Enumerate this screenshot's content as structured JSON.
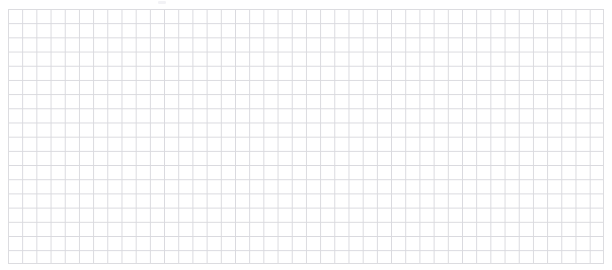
{
  "document": {
    "title": "Empty Grid Canvas",
    "width": 612,
    "height": 270,
    "background_color": "#ffffff"
  },
  "chart_data": {
    "type": "line",
    "title": "",
    "subtitle": "",
    "xlabel": "",
    "ylabel": "",
    "x": [],
    "values": [],
    "series": [],
    "categories": [],
    "tick_labels_x": [],
    "tick_labels_y": [],
    "legend_entries": [],
    "legend_position": "none",
    "annotations": [],
    "grid": true,
    "grid_style": "uniform-square",
    "grid_columns": 42,
    "grid_rows": 18,
    "grid_cell_width_px": 14.2,
    "grid_cell_height_px": 14.2,
    "grid_line_color": "#d9d9de",
    "grid_line_width_px": 1,
    "plot_area": {
      "left": 8,
      "top": 9,
      "right": 604,
      "bottom": 264,
      "width": 596,
      "height": 255
    },
    "border_color": "#dcdce0",
    "data_points_visible": 0,
    "note": "Blank graph-paper style grid with no plotted data, axes labels, ticks or legend."
  },
  "artifacts": {
    "top_mark": {
      "name": "faint-top-mark",
      "left": 158,
      "top": 1,
      "width": 8,
      "height": 3,
      "color": "#f0f0f3"
    }
  },
  "accessibility": {
    "grid_label": "Empty grid plotting surface",
    "border_label": "Grid outer border"
  }
}
